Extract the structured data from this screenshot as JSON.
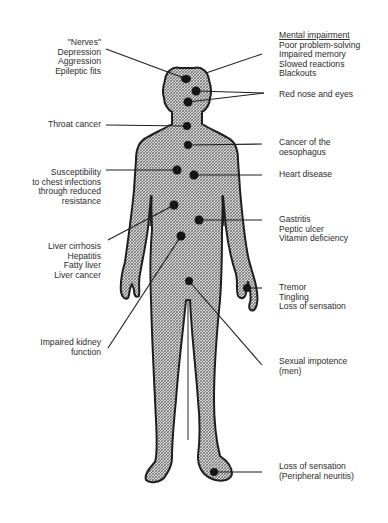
{
  "colors": {
    "ink": "#2a2a2a",
    "body_fill": "#bdbdbd",
    "dot": "#1a1a1a",
    "background": "#ffffff"
  },
  "figure": {
    "type": "human-body-outline",
    "pattern": "cross-hatched"
  },
  "left_callouts": [
    {
      "id": "nerves",
      "lines": [
        "\"Nerves\"",
        "Depression",
        "Aggression",
        "Epileptic fits"
      ]
    },
    {
      "id": "throat",
      "lines": [
        "Throat cancer"
      ]
    },
    {
      "id": "chest",
      "lines": [
        "Susceptibility",
        "to chest infections",
        "through reduced",
        "resistance"
      ]
    },
    {
      "id": "liver",
      "lines": [
        "Liver cirrhosis",
        "Hepatitis",
        "Fatty liver",
        "Liver cancer"
      ]
    },
    {
      "id": "kidney",
      "lines": [
        "Impaired kidney",
        "function"
      ]
    }
  ],
  "right_callouts": [
    {
      "id": "mental",
      "heading": "Mental impairment",
      "lines": [
        "Poor problem-solving",
        "Impaired memory",
        "Slowed reactions",
        "Blackouts"
      ]
    },
    {
      "id": "nose",
      "lines": [
        "Red nose and eyes"
      ]
    },
    {
      "id": "oesophagus",
      "lines": [
        "Cancer of the",
        "oesophagus"
      ]
    },
    {
      "id": "heart",
      "lines": [
        "Heart disease"
      ]
    },
    {
      "id": "stomach",
      "lines": [
        "Gastritis",
        "Peptic ulcer",
        "Vitamin deficiency"
      ]
    },
    {
      "id": "hand",
      "lines": [
        "Tremor",
        "Tingling",
        "Loss of sensation"
      ]
    },
    {
      "id": "sexual",
      "lines": [
        "Sexual impotence",
        "(men)"
      ]
    },
    {
      "id": "foot",
      "lines": [
        "Loss of sensation",
        "(Peripheral neuritis)"
      ]
    }
  ]
}
